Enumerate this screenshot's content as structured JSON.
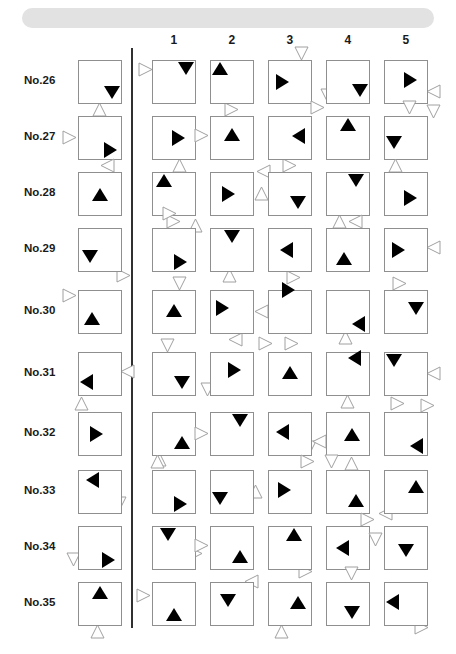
{
  "sheet": {
    "title": "Figure Matrix Test Sheet",
    "banner_color": "#e2e2e2",
    "box_border_color": "#8f8f8f",
    "divider_color": "#303030",
    "filled_color": "#000000",
    "outline_color": "#a0a0a0"
  },
  "column_headers": [
    "1",
    "2",
    "3",
    "4",
    "5"
  ],
  "rows": [
    {
      "label": "No.26",
      "stimulus": {
        "inner": {
          "dir": "down",
          "x": 26,
          "y": 26
        },
        "outer": [
          {
            "dir": "up",
            "x": 14,
            "y": 42
          }
        ]
      },
      "options": [
        {
          "inner": {
            "dir": "down",
            "x": 26,
            "y": 2
          },
          "outer": [
            {
              "dir": "right",
              "x": -14,
              "y": 2
            }
          ]
        },
        {
          "inner": {
            "dir": "up",
            "x": 2,
            "y": 2
          },
          "outer": [
            {
              "dir": "right",
              "x": 14,
              "y": 42
            }
          ]
        },
        {
          "inner": {
            "dir": "right",
            "x": 8,
            "y": 14
          },
          "outer": [
            {
              "dir": "down",
              "x": 26,
              "y": -14
            }
          ]
        },
        {
          "inner": {
            "dir": "down",
            "x": 26,
            "y": 24
          },
          "outer": [
            {
              "dir": "down",
              "x": -6,
              "y": 28
            }
          ]
        },
        {
          "inner": {
            "dir": "right",
            "x": 20,
            "y": 12
          },
          "outer": [
            {
              "dir": "left",
              "x": 42,
              "y": 24
            },
            {
              "dir": "down",
              "x": 42,
              "y": 44
            }
          ]
        }
      ]
    },
    {
      "label": "No.27",
      "stimulus": {
        "inner": {
          "dir": "right",
          "x": 26,
          "y": 26
        },
        "outer": [
          {
            "dir": "right",
            "x": -16,
            "y": 14
          }
        ]
      },
      "options": [
        {
          "inner": {
            "dir": "right",
            "x": 20,
            "y": 14
          },
          "outer": [
            {
              "dir": "up",
              "x": 20,
              "y": 42
            }
          ]
        },
        {
          "inner": {
            "dir": "up",
            "x": 14,
            "y": 12
          },
          "outer": [
            {
              "dir": "right",
              "x": -16,
              "y": 12
            }
          ]
        },
        {
          "inner": {
            "dir": "left",
            "x": 24,
            "y": 12
          },
          "outer": [
            {
              "dir": "right",
              "x": 14,
              "y": 42
            }
          ]
        },
        {
          "inner": {
            "dir": "up",
            "x": 14,
            "y": 2
          },
          "outer": [
            {
              "dir": "right",
              "x": -16,
              "y": -16
            }
          ]
        },
        {
          "inner": {
            "dir": "down",
            "x": 2,
            "y": 20
          },
          "outer": [
            {
              "dir": "down",
              "x": 18,
              "y": -16
            }
          ]
        }
      ]
    },
    {
      "label": "No.28",
      "stimulus": {
        "inner": {
          "dir": "up",
          "x": 14,
          "y": 16
        },
        "outer": [
          {
            "dir": "left",
            "x": 22,
            "y": -14
          }
        ]
      },
      "options": [
        {
          "inner": {
            "dir": "up",
            "x": 4,
            "y": 2
          },
          "outer": [
            {
              "dir": "right",
              "x": 14,
              "y": 42
            }
          ]
        },
        {
          "inner": {
            "dir": "right",
            "x": 12,
            "y": 14
          },
          "outer": [
            {
              "dir": "up",
              "x": 44,
              "y": 14
            }
          ]
        },
        {
          "inner": {
            "dir": "down",
            "x": 22,
            "y": 24
          },
          "outer": [
            {
              "dir": "left",
              "x": -12,
              "y": -8
            }
          ]
        },
        {
          "inner": {
            "dir": "down",
            "x": 22,
            "y": 2
          },
          "outer": [
            {
              "dir": "up",
              "x": 6,
              "y": 42
            }
          ]
        },
        {
          "inner": {
            "dir": "right",
            "x": 20,
            "y": 18
          },
          "outer": [
            {
              "dir": "up",
              "x": 4,
              "y": -14
            }
          ]
        }
      ]
    },
    {
      "label": "No.29",
      "stimulus": {
        "inner": {
          "dir": "down",
          "x": 4,
          "y": 22
        },
        "outer": [
          {
            "dir": "right",
            "x": 38,
            "y": 40
          }
        ]
      },
      "options": [
        {
          "inner": {
            "dir": "right",
            "x": 22,
            "y": 26
          },
          "outer": [
            {
              "dir": "right",
              "x": 10,
              "y": -22
            },
            {
              "dir": "up",
              "x": 36,
              "y": -10
            }
          ]
        },
        {
          "inner": {
            "dir": "down",
            "x": 14,
            "y": 2
          },
          "outer": [
            {
              "dir": "up",
              "x": 12,
              "y": 40
            }
          ]
        },
        {
          "inner": {
            "dir": "left",
            "x": 12,
            "y": 14
          },
          "outer": [
            {
              "dir": "right",
              "x": 18,
              "y": 42
            }
          ]
        },
        {
          "inner": {
            "dir": "up",
            "x": 10,
            "y": 24
          },
          "outer": [
            {
              "dir": "left",
              "x": 22,
              "y": -14
            }
          ]
        },
        {
          "inner": {
            "dir": "right",
            "x": 8,
            "y": 14
          },
          "outer": [
            {
              "dir": "left",
              "x": 42,
              "y": 12
            }
          ]
        }
      ]
    },
    {
      "label": "No.30",
      "stimulus": {
        "inner": {
          "dir": "up",
          "x": 6,
          "y": 22
        },
        "outer": [
          {
            "dir": "right",
            "x": -16,
            "y": -2
          }
        ]
      },
      "options": [
        {
          "inner": {
            "dir": "up",
            "x": 14,
            "y": 14
          },
          "outer": [
            {
              "dir": "down",
              "x": 20,
              "y": -14
            }
          ]
        },
        {
          "inner": {
            "dir": "right",
            "x": 6,
            "y": 10
          },
          "outer": [
            {
              "dir": "left",
              "x": 18,
              "y": 42
            }
          ]
        },
        {
          "inner": {
            "dir": "right",
            "x": 14,
            "y": -8
          },
          "outer": [
            {
              "dir": "left",
              "x": -14,
              "y": 14
            },
            {
              "dir": "right",
              "x": -10,
              "y": 46
            }
          ]
        },
        {
          "inner": {
            "dir": "left",
            "x": 26,
            "y": 26
          },
          "outer": [
            {
              "dir": "up",
              "x": 12,
              "y": 40
            }
          ]
        },
        {
          "inner": {
            "dir": "down",
            "x": 24,
            "y": 12
          },
          "outer": [
            {
              "dir": "right",
              "x": 8,
              "y": -14
            }
          ]
        }
      ]
    },
    {
      "label": "No.31",
      "stimulus": {
        "inner": {
          "dir": "left",
          "x": 2,
          "y": 22
        },
        "outer": [
          {
            "dir": "left",
            "x": 42,
            "y": 12
          }
        ]
      },
      "options": [
        {
          "inner": {
            "dir": "down",
            "x": 22,
            "y": 24
          },
          "outer": [
            {
              "dir": "down",
              "x": 8,
              "y": -14
            }
          ]
        },
        {
          "inner": {
            "dir": "right",
            "x": 18,
            "y": 10
          },
          "outer": [
            {
              "dir": "down",
              "x": -10,
              "y": 30
            }
          ]
        },
        {
          "inner": {
            "dir": "up",
            "x": 14,
            "y": 14
          },
          "outer": [
            {
              "dir": "right",
              "x": 16,
              "y": -16
            }
          ]
        },
        {
          "inner": {
            "dir": "left",
            "x": 22,
            "y": -2
          },
          "outer": [
            {
              "dir": "up",
              "x": 14,
              "y": 42
            }
          ]
        },
        {
          "inner": {
            "dir": "down",
            "x": 2,
            "y": 2
          },
          "outer": [
            {
              "dir": "left",
              "x": 42,
              "y": 14
            },
            {
              "dir": "right",
              "x": 36,
              "y": 46
            }
          ]
        }
      ]
    },
    {
      "label": "No.32",
      "stimulus": {
        "inner": {
          "dir": "right",
          "x": 12,
          "y": 14
        },
        "outer": [
          {
            "dir": "up",
            "x": -4,
            "y": -16
          }
        ]
      },
      "options": [
        {
          "inner": {
            "dir": "up",
            "x": 22,
            "y": 24
          },
          "outer": [
            {
              "dir": "up",
              "x": 0,
              "y": 40
            }
          ]
        },
        {
          "inner": {
            "dir": "down",
            "x": 22,
            "y": 2
          },
          "outer": [
            {
              "dir": "right",
              "x": -16,
              "y": 14
            }
          ]
        },
        {
          "inner": {
            "dir": "left",
            "x": 8,
            "y": 12
          },
          "outer": [
            {
              "dir": "down",
              "x": 34,
              "y": 28
            }
          ]
        },
        {
          "inner": {
            "dir": "up",
            "x": 18,
            "y": 16
          },
          "outer": [
            {
              "dir": "left",
              "x": -14,
              "y": 22
            },
            {
              "dir": "up",
              "x": 18,
              "y": 44
            }
          ]
        },
        {
          "inner": {
            "dir": "left",
            "x": 26,
            "y": 26
          },
          "outer": [
            {
              "dir": "right",
              "x": 6,
              "y": -16
            }
          ]
        }
      ]
    },
    {
      "label": "No.33",
      "stimulus": {
        "inner": {
          "dir": "left",
          "x": 8,
          "y": 2
        },
        "outer": [
          {
            "dir": "down",
            "x": 34,
            "y": 26
          }
        ]
      },
      "options": [
        {
          "inner": {
            "dir": "right",
            "x": 22,
            "y": 26
          },
          "outer": [
            {
              "dir": "up",
              "x": -2,
              "y": -16
            }
          ]
        },
        {
          "inner": {
            "dir": "down",
            "x": 2,
            "y": 22
          },
          "outer": [
            {
              "dir": "up",
              "x": 38,
              "y": 14
            }
          ]
        },
        {
          "inner": {
            "dir": "right",
            "x": 10,
            "y": 12
          },
          "outer": [
            {
              "dir": "right",
              "x": 32,
              "y": -16
            }
          ]
        },
        {
          "inner": {
            "dir": "up",
            "x": 22,
            "y": 24
          },
          "outer": [
            {
              "dir": "down",
              "x": -2,
              "y": -16
            }
          ]
        },
        {
          "inner": {
            "dir": "up",
            "x": 24,
            "y": 10
          },
          "outer": [
            {
              "dir": "left",
              "x": -6,
              "y": 36
            }
          ]
        }
      ]
    },
    {
      "label": "No.34",
      "stimulus": {
        "inner": {
          "dir": "right",
          "x": 24,
          "y": 26
        },
        "outer": [
          {
            "dir": "down",
            "x": -12,
            "y": 26
          }
        ]
      },
      "options": [
        {
          "inner": {
            "dir": "down",
            "x": 8,
            "y": 2
          },
          "outer": [
            {
              "dir": "right",
              "x": 36,
              "y": 20
            }
          ]
        },
        {
          "inner": {
            "dir": "up",
            "x": 22,
            "y": 24
          },
          "outer": [
            {
              "dir": "right",
              "x": -16,
              "y": 12
            }
          ]
        },
        {
          "inner": {
            "dir": "up",
            "x": 18,
            "y": 2
          },
          "outer": [
            {
              "dir": "right",
              "x": 30,
              "y": 38
            }
          ]
        },
        {
          "inner": {
            "dir": "left",
            "x": 10,
            "y": 14
          },
          "outer": [
            {
              "dir": "right",
              "x": 34,
              "y": -14
            }
          ]
        },
        {
          "inner": {
            "dir": "down",
            "x": 14,
            "y": 18
          },
          "outer": [
            {
              "dir": "down",
              "x": -16,
              "y": 6
            }
          ]
        }
      ]
    },
    {
      "label": "No.35",
      "stimulus": {
        "inner": {
          "dir": "up",
          "x": 14,
          "y": 4
        },
        "outer": [
          {
            "dir": "up",
            "x": 12,
            "y": 42
          }
        ]
      },
      "options": [
        {
          "inner": {
            "dir": "up",
            "x": 14,
            "y": 26
          },
          "outer": [
            {
              "dir": "right",
              "x": -16,
              "y": 6
            }
          ]
        },
        {
          "inner": {
            "dir": "down",
            "x": 10,
            "y": 12
          },
          "outer": [
            {
              "dir": "left",
              "x": 34,
              "y": -8
            }
          ]
        },
        {
          "inner": {
            "dir": "up",
            "x": 22,
            "y": 14
          },
          "outer": [
            {
              "dir": "up",
              "x": 6,
              "y": 42
            }
          ]
        },
        {
          "inner": {
            "dir": "down",
            "x": 18,
            "y": 24
          },
          "outer": [
            {
              "dir": "down",
              "x": 18,
              "y": -16
            }
          ]
        },
        {
          "inner": {
            "dir": "left",
            "x": 2,
            "y": 12
          },
          "outer": [
            {
              "dir": "right",
              "x": 30,
              "y": 38
            }
          ]
        }
      ]
    }
  ],
  "layout": {
    "stimulus_x": 78,
    "option_x": [
      152,
      210,
      268,
      326,
      384
    ],
    "row_y": [
      60,
      116,
      172,
      228,
      290,
      352,
      412,
      470,
      526,
      582
    ],
    "cell_size": 44
  }
}
